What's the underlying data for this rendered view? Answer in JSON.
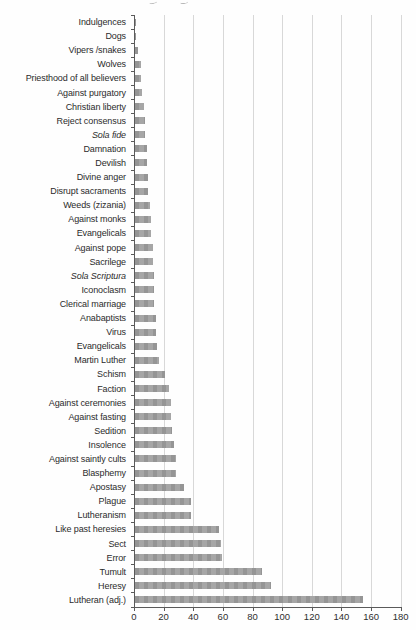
{
  "figure": {
    "kind": "scanned horizontal bar chart, no title, no legend",
    "x_axis_side": "bottom",
    "category_axis_side": "left"
  },
  "chart_data": {
    "type": "bar",
    "orientation": "horizontal",
    "title": "",
    "xlabel": "",
    "ylabel": "",
    "xlim": [
      0,
      180
    ],
    "x_ticks": [
      0,
      20,
      40,
      60,
      80,
      100,
      120,
      140,
      160,
      180
    ],
    "grid": "vertical gridlines at each x tick",
    "legend": "none",
    "categories": [
      "Indulgences",
      "Dogs",
      "Vipers /snakes",
      "Wolves",
      "Priesthood of all believers",
      "Against purgatory",
      "Christian liberty",
      "Reject consensus",
      "Sola fide",
      "Damnation",
      "Devilish",
      "Divine anger",
      "Disrupt sacraments",
      "Weeds (zizania)",
      "Against monks",
      "Evangelicals",
      "Against pope",
      "Sacrilege",
      "Sola Scriptura",
      "Iconoclasm",
      "Clerical marriage",
      "Anabaptists",
      "Virus",
      "Evangelicals",
      "Martin Luther",
      "Schism",
      "Faction",
      "Against ceremonies",
      "Against fasting",
      "Sedition",
      "Insolence",
      "Against saintly cults",
      "Blasphemy",
      "Apostasy",
      "Plague",
      "Lutheranism",
      "Like past heresies",
      "Sect",
      "Error",
      "Tumult",
      "Heresy",
      "Lutheran (adj.)"
    ],
    "values": [
      1,
      1,
      2,
      4,
      4,
      5,
      6,
      7,
      7,
      8,
      8,
      9,
      9,
      10,
      11,
      11,
      12,
      12,
      13,
      13,
      13,
      14,
      14,
      15,
      16,
      20,
      23,
      24,
      24,
      25,
      26,
      28,
      28,
      33,
      38,
      38,
      57,
      58,
      59,
      86,
      92,
      154
    ],
    "italic_categories": [
      "Sola fide",
      "Sola Scriptura"
    ],
    "colors": {
      "bar": "#9d9d9d",
      "gridline": "#d8d8d8",
      "axis": "#5a5a5a",
      "text": "#2b2b2b",
      "background": "#fefefe"
    }
  }
}
